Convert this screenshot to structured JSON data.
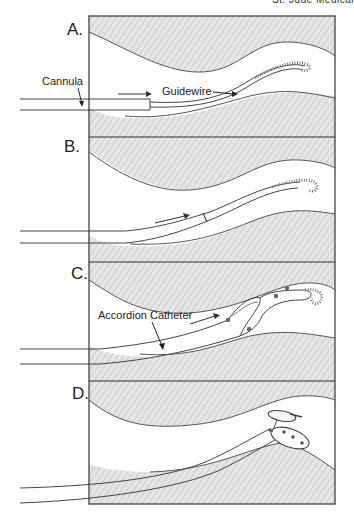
{
  "figure": {
    "header_fragment": "St. Jude Medical",
    "panels": [
      {
        "label": "A.",
        "annotations": [
          "Cannula",
          "Guidewire"
        ]
      },
      {
        "label": "B.",
        "annotations": []
      },
      {
        "label": "C.",
        "annotations": [
          "Accordion Catheter"
        ]
      },
      {
        "label": "D.",
        "annotations": []
      }
    ],
    "colors": {
      "tissue_fill": "#e4e4e4",
      "hatch": "#b5b5b5",
      "line": "#3a3a3a",
      "vessel": "#ffffff"
    }
  }
}
